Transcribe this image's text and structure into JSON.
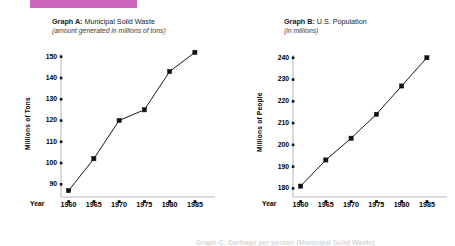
{
  "banner": {
    "color": "#cc66bb"
  },
  "charts": {
    "a": {
      "label": "Graph A:",
      "name": "Municipal Solid Waste",
      "subtitle": "(amount generated in millions of tons)",
      "ylabel": "Millions of Tons",
      "xaxis_name": "Year"
    },
    "b": {
      "label": "Graph B:",
      "name": "U.S. Population",
      "subtitle": "(in millions)",
      "ylabel": "Millions of People",
      "xaxis_name": "Year"
    }
  },
  "footer": {
    "text": "Graph C: Garbage per person (Municipal Solid Waste)"
  },
  "chart_data": [
    {
      "type": "line",
      "id": "graph-a",
      "title": "Graph A: Municipal Solid Waste",
      "subtitle": "(amount generated in millions of tons)",
      "xlabel": "Year",
      "ylabel": "Millions of Tons",
      "x": [
        1960,
        1965,
        1970,
        1975,
        1980,
        1985
      ],
      "xtick_labels": [
        "1960",
        "1965",
        "1970",
        "1975",
        "1980",
        "1985"
      ],
      "values": [
        87,
        102,
        120,
        125,
        143,
        152
      ],
      "yticks": [
        90,
        100,
        110,
        120,
        130,
        140,
        150
      ],
      "ylim": [
        84,
        155
      ],
      "xlim": [
        1958.5,
        1987
      ],
      "grid": false,
      "legend": "none",
      "marker": "filled-square",
      "line_color": "#000000"
    },
    {
      "type": "line",
      "id": "graph-b",
      "title": "Graph B: U.S. Population",
      "subtitle": "(in millions)",
      "xlabel": "Year",
      "ylabel": "Millions of People",
      "x": [
        1960,
        1965,
        1970,
        1975,
        1980,
        1985
      ],
      "xtick_labels": [
        "1960",
        "1965",
        "1970",
        "1975",
        "1980",
        "1985"
      ],
      "values": [
        181,
        193,
        203,
        214,
        227,
        240
      ],
      "yticks": [
        180,
        190,
        200,
        210,
        220,
        230,
        240
      ],
      "ylim": [
        176,
        244
      ],
      "xlim": [
        1958.5,
        1987
      ],
      "grid": false,
      "legend": "none",
      "marker": "filled-square",
      "line_color": "#000000"
    }
  ]
}
